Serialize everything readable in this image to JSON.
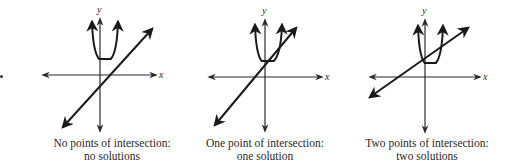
{
  "figure": {
    "panels": [
      {
        "id": "no-intersection",
        "caption_line1": "No points of intersection:",
        "caption_line2": "no solutions",
        "axis_label_x": "x",
        "axis_label_y": "y",
        "origin": [
          100,
          75
        ],
        "x_axis": [
          43,
          156
        ],
        "y_axis": [
          19,
          131
        ],
        "parabola": {
          "left_tip": [
            92,
            22
          ],
          "vertex": [
            105,
            58
          ],
          "right_tip": [
            118,
            22
          ]
        },
        "line": {
          "start": [
            63,
            127
          ],
          "end": [
            152,
            29
          ]
        },
        "caption_center_x": 112,
        "intersections": 0
      },
      {
        "id": "one-intersection",
        "caption_line1": "One point of intersection:",
        "caption_line2": "one solution",
        "axis_label_x": "x",
        "axis_label_y": "y",
        "origin": [
          265,
          77
        ],
        "x_axis": [
          209,
          322
        ],
        "y_axis": [
          20,
          131
        ],
        "parabola": {
          "left_tip": [
            255,
            25
          ],
          "vertex": [
            267,
            60
          ],
          "right_tip": [
            282,
            25
          ]
        },
        "line": {
          "start": [
            215,
            125
          ],
          "end": [
            296,
            28
          ]
        },
        "caption_center_x": 265,
        "intersections": 1
      },
      {
        "id": "two-intersections",
        "caption_line1": "Two points of intersection:",
        "caption_line2": "two solutions",
        "axis_label_x": "x",
        "axis_label_y": "y",
        "origin": [
          425,
          77
        ],
        "x_axis": [
          370,
          480
        ],
        "y_axis": [
          20,
          132
        ],
        "parabola": {
          "left_tip": [
            418,
            26
          ],
          "vertex": [
            430,
            62
          ],
          "right_tip": [
            443,
            26
          ]
        },
        "line": {
          "start": [
            370,
            97
          ],
          "end": [
            468,
            28
          ]
        },
        "caption_center_x": 427,
        "intersections": 2
      }
    ],
    "colors": {
      "stroke": "#1a1a1a",
      "axis": "#2b2b2b",
      "text": "#2a2a2a"
    }
  }
}
